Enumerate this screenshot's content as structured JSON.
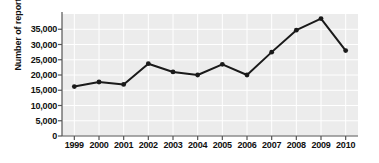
{
  "chart_data": {
    "type": "line",
    "title": "",
    "subtitle": "",
    "xlabel": "",
    "ylabel": "Number of reported cases",
    "categories": [
      "1999",
      "2000",
      "2001",
      "2002",
      "2003",
      "2004",
      "2005",
      "2006",
      "2007",
      "2008",
      "2009",
      "2010"
    ],
    "values": [
      16200,
      17700,
      16900,
      23700,
      21000,
      20000,
      23500,
      20000,
      27500,
      34700,
      38500,
      28000
    ],
    "series": [
      {
        "name": "Number of reported cases",
        "values": [
          16200,
          17700,
          16900,
          23700,
          21000,
          20000,
          23500,
          20000,
          27500,
          34700,
          38500,
          28000
        ]
      }
    ],
    "x_tick_labels": [
      "1999",
      "2000",
      "2001",
      "2002",
      "2003",
      "2004",
      "2005",
      "2006",
      "2007",
      "2008",
      "2009",
      "2010"
    ],
    "y_tick_labels": [
      "0",
      "5,000",
      "10,000",
      "15,000",
      "20,000",
      "25,000",
      "30,000",
      "35,000"
    ],
    "y_tick_values": [
      0,
      5000,
      10000,
      15000,
      20000,
      25000,
      30000,
      35000
    ],
    "ylim": [
      0,
      40000
    ],
    "xlim_categories": 12,
    "grid": true,
    "grid_axis": "both",
    "legend": false,
    "legend_position": "none",
    "annotations": [],
    "colors": {
      "line": "#1a1a1a",
      "marker": "#1a1a1a",
      "plot_background": "#ececec",
      "gridline": "#ffffff",
      "axis": "#555555",
      "text": "#101010",
      "figure_background": "#ffffff"
    },
    "marker_style": "circle",
    "line_width": 2
  }
}
